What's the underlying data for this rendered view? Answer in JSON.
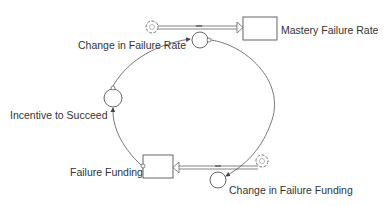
{
  "diagram": {
    "type": "stock-and-flow",
    "stocks": [
      {
        "id": "mastery",
        "label": "Mastery Failure Rate"
      },
      {
        "id": "funding",
        "label": "Failure Funding"
      }
    ],
    "flows": [
      {
        "id": "change_rate",
        "label": "Change in Failure Rate",
        "into": "mastery"
      },
      {
        "id": "change_funding",
        "label": "Change in Failure Funding",
        "into": "funding"
      }
    ],
    "auxiliaries": [
      {
        "id": "incentive",
        "label": "Incentive to Succeed"
      }
    ],
    "links": [
      {
        "from": "mastery",
        "to": "change_funding"
      },
      {
        "from": "funding",
        "to": "incentive"
      },
      {
        "from": "incentive",
        "to": "change_rate"
      }
    ],
    "colors": {
      "line": "#555555",
      "text": "#333333",
      "background": "#ffffff"
    }
  }
}
